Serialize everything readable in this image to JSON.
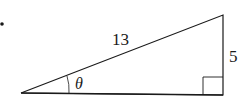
{
  "diagram": {
    "type": "right-triangle",
    "bullet": "•",
    "hypotenuse_label": "13",
    "opposite_label": "5",
    "angle_label": "θ",
    "right_angle_marker": true,
    "stroke_color": "#1a1a1a",
    "background": "#ffffff"
  }
}
